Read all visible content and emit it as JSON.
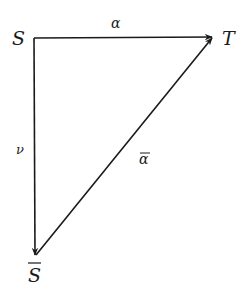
{
  "diagram": {
    "type": "commutative-triangle",
    "nodes": {
      "S": {
        "label": "S"
      },
      "T": {
        "label": "T"
      },
      "S_bar": {
        "label": "S",
        "overline": true
      }
    },
    "edges": {
      "alpha": {
        "label": "α",
        "from": "S",
        "to": "T"
      },
      "nu": {
        "label": "ν",
        "from": "S",
        "to": "S_bar"
      },
      "alpha_bar": {
        "label": "α",
        "overline": true,
        "from": "S_bar",
        "to": "T"
      }
    },
    "colors": {
      "stroke": "#1a1a1a",
      "background": "#ffffff"
    }
  }
}
